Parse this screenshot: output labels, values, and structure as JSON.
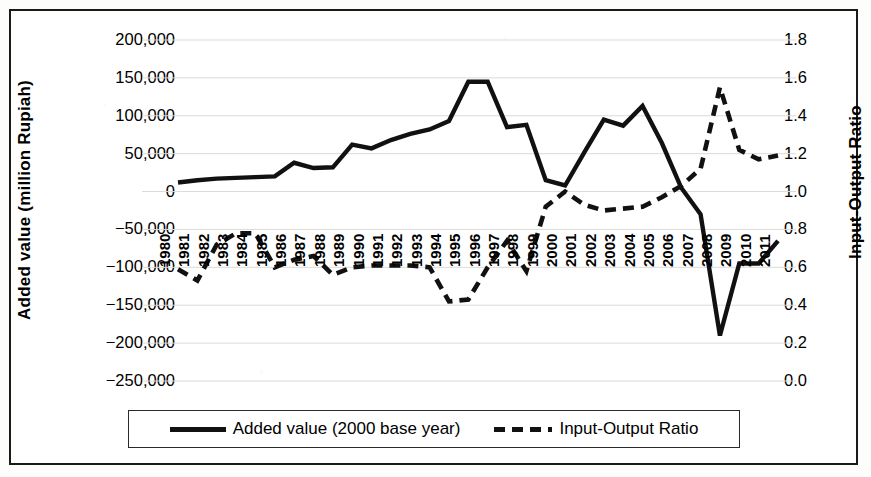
{
  "figure": {
    "border_color": "#1a1a1a",
    "line_color": "#111111"
  },
  "axes": {
    "left": {
      "title": "Added value (million Rupiah)",
      "ticks": [
        "200,000",
        "150,000",
        "100,000",
        "50,000",
        "0",
        "−50,000",
        "−100,000",
        "−150,000",
        "−200,000",
        "−250,000"
      ],
      "min": -250000,
      "max": 200000,
      "step": 50000
    },
    "right": {
      "title": "Input-Output Ratio",
      "ticks": [
        "1.8",
        "1.6",
        "1.4",
        "1.2",
        "1.0",
        "0.8",
        "0.6",
        "0.4",
        "0.2",
        "0.0"
      ],
      "min": 0.0,
      "max": 1.8,
      "step": 0.2
    },
    "x": {
      "ticks": [
        "1980",
        "1981",
        "1982",
        "1983",
        "1984",
        "1985",
        "1986",
        "1987",
        "1988",
        "1989",
        "1990",
        "1991",
        "1992",
        "1993",
        "1994",
        "1995",
        "1996",
        "1997",
        "1998",
        "1999",
        "2000",
        "2001",
        "2002",
        "2003",
        "2004",
        "2005",
        "2006",
        "2007",
        "2008",
        "2009",
        "2010",
        "2011"
      ]
    }
  },
  "legend": {
    "items": [
      {
        "label": "Added value (2000 base year)",
        "style": "solid"
      },
      {
        "label": "Input-Output Ratio",
        "style": "dashed"
      }
    ]
  },
  "chart_data": {
    "type": "line",
    "title": "",
    "xlabel": "",
    "ylabel": "Added value (million Rupiah)",
    "y2label": "Input-Output Ratio",
    "ylim": [
      -250000,
      200000
    ],
    "y2lim": [
      0.0,
      1.8
    ],
    "grid": true,
    "legend_position": "bottom",
    "categories": [
      "1980",
      "1981",
      "1982",
      "1983",
      "1984",
      "1985",
      "1986",
      "1987",
      "1988",
      "1989",
      "1990",
      "1991",
      "1992",
      "1993",
      "1994",
      "1995",
      "1996",
      "1997",
      "1998",
      "1999",
      "2000",
      "2001",
      "2002",
      "2003",
      "2004",
      "2005",
      "2006",
      "2007",
      "2008",
      "2009",
      "2010",
      "2011"
    ],
    "series": [
      {
        "name": "Added value (2000 base year)",
        "axis": "left",
        "style": "solid",
        "values": [
          12000,
          15000,
          17000,
          18000,
          19000,
          20000,
          38000,
          31000,
          32000,
          62000,
          57000,
          68000,
          76000,
          82000,
          93000,
          145000,
          145000,
          85000,
          88000,
          15000,
          8000,
          52000,
          95000,
          87000,
          113000,
          64000,
          5000,
          -30000,
          -190000,
          -95000,
          -95000,
          -65000
        ]
      },
      {
        "name": "Input-Output Ratio",
        "axis": "right",
        "style": "dashed",
        "values": [
          0.59,
          0.53,
          0.72,
          0.78,
          0.78,
          0.6,
          0.64,
          0.66,
          0.56,
          0.6,
          0.61,
          0.61,
          0.61,
          0.6,
          0.42,
          0.43,
          0.6,
          0.74,
          0.58,
          0.92,
          1.0,
          0.93,
          0.9,
          0.91,
          0.92,
          0.97,
          1.03,
          1.12,
          1.55,
          1.22,
          1.17,
          1.19
        ]
      }
    ]
  }
}
